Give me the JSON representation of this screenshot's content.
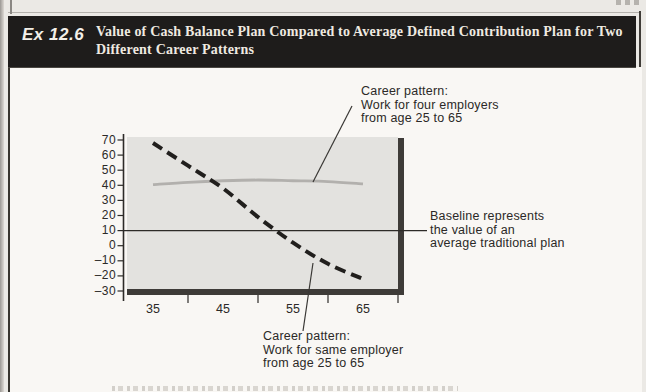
{
  "header": {
    "exhibit_label": "Ex 12.6",
    "title_line1": "Value of Cash Balance Plan Compared to Average Defined Contribution Plan for Two",
    "title_line2": "Different Career Patterns",
    "bar_color": "#1e1c1b",
    "text_color": "#efeae1"
  },
  "annotations": {
    "four_employers": {
      "lines": [
        "Career pattern:",
        "Work for four employers",
        "from age 25 to 65"
      ]
    },
    "baseline": {
      "lines": [
        "Baseline represents",
        "the value of an",
        "average traditional plan"
      ]
    },
    "same_employer": {
      "lines": [
        "Career pattern:",
        "Work for same employer",
        "from age 25 to 65"
      ]
    }
  },
  "chart_data": {
    "type": "line",
    "title": "Value of Cash Balance Plan Compared to Average Defined Contribution Plan for Two Different Career Patterns",
    "xlabel": "",
    "ylabel": "",
    "x_axis": {
      "labeled_ticks": [
        35,
        45,
        55,
        65
      ],
      "minor_ticks": [
        40,
        50,
        60,
        70
      ],
      "range": [
        31,
        70
      ]
    },
    "y_axis": {
      "ticks": [
        70,
        60,
        50,
        40,
        30,
        20,
        10,
        0,
        -10,
        -20,
        -30
      ],
      "range": [
        -30,
        70
      ]
    },
    "baseline": {
      "value": 10,
      "label": "Baseline represents the value of an average traditional plan"
    },
    "series": [
      {
        "name": "Career pattern: Work for four employers from age 25 to 65",
        "line_style": "solid",
        "color": "#b2b0ad",
        "x": [
          35,
          40,
          45,
          50,
          55,
          60,
          65
        ],
        "values": [
          40.5,
          42,
          43,
          43.5,
          43,
          42.5,
          41
        ]
      },
      {
        "name": "Career pattern: Work for same employer from age 25 to 65",
        "line_style": "dashed",
        "color": "#211f1d",
        "x": [
          35,
          40,
          45,
          50,
          55,
          60,
          65
        ],
        "values": [
          68,
          53,
          38,
          19,
          2,
          -12,
          -22
        ]
      }
    ],
    "plot_bg_color": "#e3e2df",
    "axis_bar_color": "#3e3b38",
    "grid": "off",
    "legend": "annotated-with-leader-lines"
  }
}
